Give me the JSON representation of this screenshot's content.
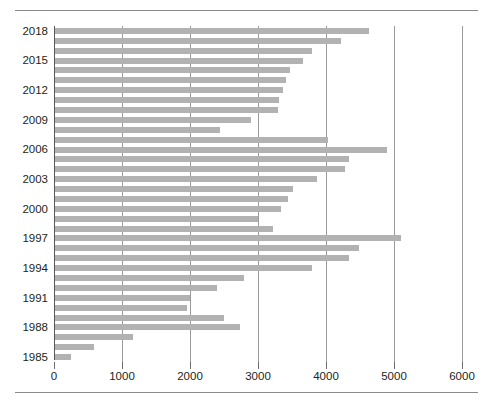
{
  "chart_data": {
    "type": "bar",
    "orientation": "horizontal",
    "title": "",
    "subtitle": "",
    "xlabel": "",
    "ylabel": "",
    "xlim": [
      0,
      6000
    ],
    "ylim_categories": [
      "1985",
      "2018"
    ],
    "grid": "vertical",
    "legend": "none",
    "bar_color": "#b2b2b2",
    "xticks": [
      0,
      1000,
      2000,
      3000,
      4000,
      5000,
      6000
    ],
    "xtick_labels": [
      "0",
      "1000",
      "2000",
      "3000",
      "4000",
      "5000",
      "6000"
    ],
    "ytick_labels": [
      "2018",
      "2015",
      "2012",
      "2009",
      "2006",
      "2003",
      "2000",
      "1997",
      "1994",
      "1991",
      "1988",
      "1985"
    ],
    "categories": [
      "2018",
      "2017",
      "2016",
      "2015",
      "2014",
      "2013",
      "2012",
      "2011",
      "2010",
      "2009",
      "2008",
      "2007",
      "2006",
      "2005",
      "2004",
      "2003",
      "2002",
      "2001",
      "2000",
      "1999",
      "1998",
      "1997",
      "1996",
      "1995",
      "1994",
      "1993",
      "1992",
      "1991",
      "1990",
      "1989",
      "1988",
      "1987",
      "1986",
      "1985"
    ],
    "values": [
      4620,
      4200,
      3780,
      3650,
      3450,
      3400,
      3350,
      3300,
      3280,
      2880,
      2420,
      4020,
      4880,
      4320,
      4270,
      3860,
      3500,
      3420,
      3330,
      2980,
      3200,
      5090,
      4470,
      4320,
      3780,
      2780,
      2380,
      1980,
      1940,
      2480,
      2720,
      1150,
      580,
      240
    ]
  },
  "source": {
    "text": ""
  }
}
